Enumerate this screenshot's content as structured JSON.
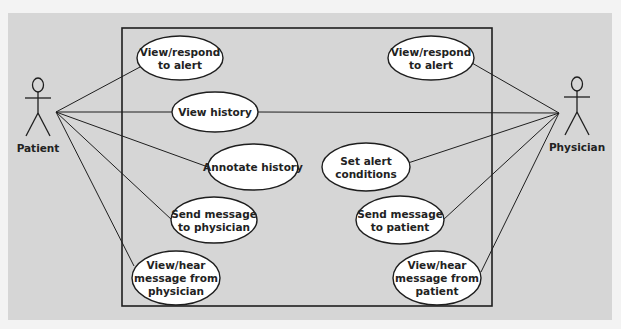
{
  "diagram": {
    "type": "uml-use-case",
    "colors": {
      "page_bg": "#f3f3f3",
      "panel_bg": "#d6d6d6",
      "stroke": "#1e1e1e",
      "ellipse_fill": "#ffffff",
      "text": "#222222"
    },
    "system_boundary": {
      "x": 122,
      "y": 28,
      "w": 370,
      "h": 278
    },
    "actors": [
      {
        "id": "patient",
        "label": "Patient",
        "x": 38,
        "hub": [
          56,
          112
        ]
      },
      {
        "id": "physician",
        "label": "Physician",
        "x": 577,
        "hub": [
          559,
          113
        ]
      }
    ],
    "use_cases": [
      {
        "id": "uc1",
        "lines": [
          "View/respond",
          "to alert"
        ],
        "cx": 180,
        "cy": 58,
        "rx": 43,
        "ry": 22,
        "actor": "patient"
      },
      {
        "id": "uc2",
        "lines": [
          "View history"
        ],
        "cx": 215,
        "cy": 112,
        "rx": 43,
        "ry": 20,
        "actor": "patient+physician"
      },
      {
        "id": "uc3",
        "lines": [
          "Annotate history"
        ],
        "cx": 253,
        "cy": 167,
        "rx": 45,
        "ry": 23,
        "actor": "patient"
      },
      {
        "id": "uc4",
        "lines": [
          "Send message",
          "to physician"
        ],
        "cx": 214,
        "cy": 220,
        "rx": 43,
        "ry": 23,
        "actor": "patient"
      },
      {
        "id": "uc5",
        "lines": [
          "View/hear",
          "message from",
          "physician"
        ],
        "cx": 176,
        "cy": 278,
        "rx": 44,
        "ry": 27,
        "actor": "patient"
      },
      {
        "id": "uc6",
        "lines": [
          "View/respond",
          "to alert"
        ],
        "cx": 431,
        "cy": 58,
        "rx": 43,
        "ry": 22,
        "actor": "physician"
      },
      {
        "id": "uc7",
        "lines": [
          "Set alert",
          "conditions"
        ],
        "cx": 366,
        "cy": 167,
        "rx": 44,
        "ry": 24,
        "actor": "physician"
      },
      {
        "id": "uc8",
        "lines": [
          "Send message",
          "to patient"
        ],
        "cx": 400,
        "cy": 220,
        "rx": 44,
        "ry": 24,
        "actor": "physician"
      },
      {
        "id": "uc9",
        "lines": [
          "View/hear",
          "message from",
          "patient"
        ],
        "cx": 437,
        "cy": 278,
        "rx": 44,
        "ry": 27,
        "actor": "physician"
      }
    ],
    "associations": [
      {
        "from": "patient",
        "to": "uc1",
        "end": [
          140,
          67
        ]
      },
      {
        "from": "patient",
        "to": "uc2",
        "end": [
          172,
          112
        ]
      },
      {
        "from": "patient",
        "to": "uc3",
        "end": [
          208,
          167
        ]
      },
      {
        "from": "patient",
        "to": "uc4",
        "end": [
          172,
          220
        ]
      },
      {
        "from": "patient",
        "to": "uc5",
        "end": [
          134,
          266
        ]
      },
      {
        "from": "physician",
        "to": "uc2",
        "end": [
          258,
          112
        ]
      },
      {
        "from": "physician",
        "to": "uc6",
        "end": [
          472,
          63
        ]
      },
      {
        "from": "physician",
        "to": "uc7",
        "end": [
          408,
          163
        ]
      },
      {
        "from": "physician",
        "to": "uc8",
        "end": [
          443,
          220
        ]
      },
      {
        "from": "physician",
        "to": "uc9",
        "end": [
          481,
          272
        ]
      }
    ]
  }
}
